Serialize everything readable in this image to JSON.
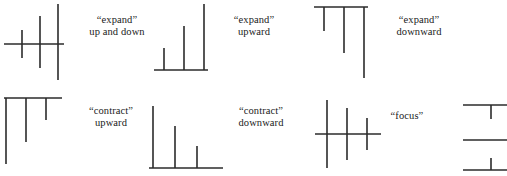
{
  "figure": {
    "width": 507,
    "height": 176,
    "background_color": "#ffffff",
    "stroke_color": "#2b2b2b",
    "text_color": "#1a1a1a",
    "panels": [
      {
        "id": "expand-up-and-down",
        "caption_line1": "“expand”",
        "caption_line2": "up and down",
        "diagram_type": "cross-axis-growing",
        "description": "horizontal axis with three crossing vertical strokes of increasing total length",
        "strokes": [
          {
            "x": 22,
            "up": 14,
            "down": 14
          },
          {
            "x": 40,
            "up": 28,
            "down": 24
          },
          {
            "x": 58,
            "up": 40,
            "down": 36
          }
        ],
        "axis": {
          "y": 44,
          "x1": 4,
          "x2": 64
        }
      },
      {
        "id": "expand-upward",
        "caption_line1": "“expand”",
        "caption_line2": "upward",
        "diagram_type": "baseline-bars-increasing",
        "description": "baseline with three upward strokes of increasing height",
        "strokes": [
          {
            "x": 14,
            "height": 22
          },
          {
            "x": 34,
            "height": 44
          },
          {
            "x": 54,
            "height": 66
          }
        ],
        "axis": {
          "y": 70,
          "x1": 4,
          "x2": 58
        }
      },
      {
        "id": "expand-downward",
        "caption_line1": "“expand”",
        "caption_line2": "downward",
        "diagram_type": "topline-bars-increasing",
        "description": "top line with three downward strokes of increasing length",
        "strokes": [
          {
            "x": 14,
            "length": 24
          },
          {
            "x": 34,
            "length": 46
          },
          {
            "x": 54,
            "length": 68
          }
        ],
        "axis": {
          "y": 6,
          "x1": 4,
          "x2": 58
        }
      },
      {
        "id": "contract-upward",
        "caption_line1": "“contract”",
        "caption_line2": "upward",
        "diagram_type": "topline-bars-decreasing",
        "description": "top line with three downward strokes of decreasing length",
        "strokes": [
          {
            "x": 6,
            "length": 66
          },
          {
            "x": 26,
            "length": 44
          },
          {
            "x": 46,
            "length": 22
          }
        ],
        "axis": {
          "y": 6,
          "x1": 4,
          "x2": 58
        }
      },
      {
        "id": "contract-downward",
        "caption_line1": "“contract”",
        "caption_line2": "downward",
        "diagram_type": "baseline-bars-decreasing",
        "description": "baseline with three upward strokes of decreasing height",
        "strokes": [
          {
            "x": 8,
            "height": 62
          },
          {
            "x": 30,
            "height": 42
          },
          {
            "x": 52,
            "height": 22
          }
        ],
        "axis": {
          "y": 68,
          "x1": 4,
          "x2": 74
        }
      },
      {
        "id": "focus",
        "caption_line1": "“focus”",
        "caption_line2": "",
        "diagram_type": "cross-axis-shrinking",
        "description": "horizontal axis with three crossing vertical strokes of decreasing total length",
        "strokes": [
          {
            "x": 12,
            "up": 34,
            "down": 34
          },
          {
            "x": 32,
            "up": 26,
            "down": 26
          },
          {
            "x": 52,
            "up": 16,
            "down": 16
          }
        ],
        "axis": {
          "y": 44,
          "x1": 2,
          "x2": 66
        }
      },
      {
        "id": "partial-right-edge",
        "caption_line1": "",
        "caption_line2": "",
        "diagram_type": "cropped-tee-pair",
        "description": "partially cropped diagram at the right edge showing two horizontal lines with short downward strokes",
        "strokes": [
          {
            "x": 28,
            "length": 12
          },
          {
            "x": 28,
            "length": 12
          }
        ],
        "axis": {
          "y": 0,
          "x1": 0,
          "x2": 40
        }
      }
    ]
  }
}
